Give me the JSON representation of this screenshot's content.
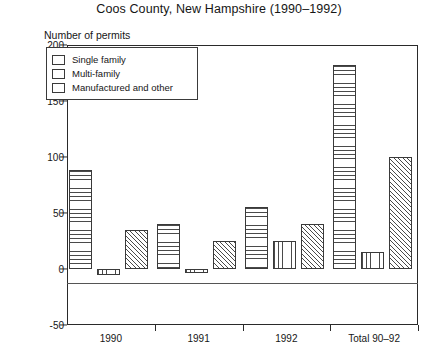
{
  "chart_data": {
    "type": "bar",
    "title": "Coos County, New Hampshire (1990–1992)",
    "xlabel": "",
    "ylabel": "Number of permits",
    "categories": [
      "1990",
      "1991",
      "1992",
      "Total 90–92"
    ],
    "series": [
      {
        "name": "Single family",
        "values": [
          88,
          40,
          55,
          182
        ],
        "pattern": "horizontal-lines"
      },
      {
        "name": "Multi-family",
        "values": [
          -5,
          -4,
          25,
          15
        ],
        "pattern": "vertical-lines"
      },
      {
        "name": "Manufactured and other",
        "values": [
          35,
          25,
          40,
          100
        ],
        "pattern": "diagonal-hatch"
      }
    ],
    "ylim": [
      -50,
      200
    ],
    "yticks": [
      200,
      150,
      100,
      50,
      0,
      -50
    ],
    "ytick_labels": [
      "200",
      "150",
      "100",
      "50",
      "0",
      "-50"
    ],
    "grid": false,
    "legend_position": "top-left",
    "line_color": "#3a3a3a",
    "background": "#ffffff"
  },
  "legend": {
    "items": [
      {
        "label": "Single family"
      },
      {
        "label": "Multi-family"
      },
      {
        "label": "Manufactured and other"
      }
    ]
  }
}
